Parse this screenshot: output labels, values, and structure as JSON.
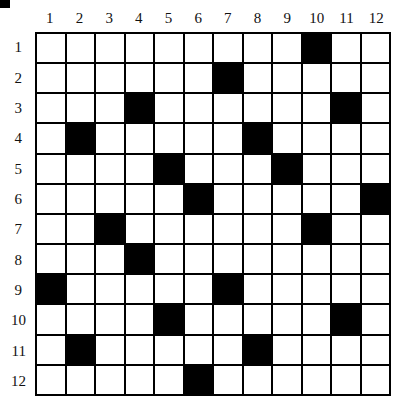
{
  "puzzle": {
    "rows": 12,
    "cols": 12,
    "col_labels": [
      "1",
      "2",
      "3",
      "4",
      "5",
      "6",
      "7",
      "8",
      "9",
      "10",
      "11",
      "12"
    ],
    "row_labels": [
      "1",
      "2",
      "3",
      "4",
      "5",
      "6",
      "7",
      "8",
      "9",
      "10",
      "11",
      "12"
    ],
    "black_cells": [
      [
        1,
        10
      ],
      [
        2,
        7
      ],
      [
        3,
        4
      ],
      [
        3,
        11
      ],
      [
        4,
        2
      ],
      [
        4,
        8
      ],
      [
        5,
        5
      ],
      [
        5,
        9
      ],
      [
        6,
        6
      ],
      [
        6,
        12
      ],
      [
        7,
        3
      ],
      [
        7,
        10
      ],
      [
        8,
        4
      ],
      [
        9,
        1
      ],
      [
        9,
        7
      ],
      [
        10,
        5
      ],
      [
        10,
        11
      ],
      [
        11,
        2
      ],
      [
        11,
        8
      ],
      [
        12,
        6
      ]
    ],
    "colors": {
      "black": "#000000",
      "white": "#ffffff",
      "grid_line": "#000000"
    }
  }
}
